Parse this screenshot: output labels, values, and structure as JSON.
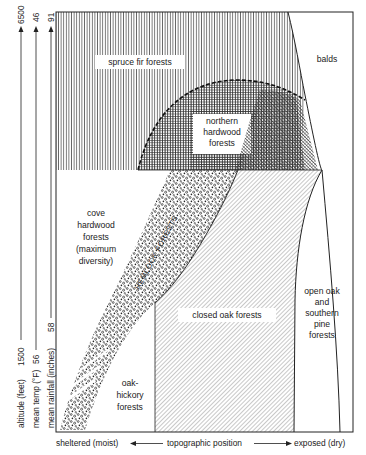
{
  "diagram": {
    "type": "vegetation zonation diagram",
    "y_axes": [
      {
        "id": "altitude",
        "label": "altitude (feet)",
        "low": "1500",
        "high": "6500"
      },
      {
        "id": "temp",
        "label": "mean temp (°F)",
        "low": "56",
        "high": "46"
      },
      {
        "id": "rainfall",
        "label": "mean rainfall (inches)",
        "low": "58",
        "high": "91"
      }
    ],
    "x_axis": {
      "left": "sheltered (moist)",
      "center": "topographic position",
      "right": "exposed (dry)"
    },
    "zones": [
      {
        "id": "spruce-fir",
        "label": "spruce fir forests",
        "pattern": "vertical lines"
      },
      {
        "id": "balds",
        "label": "balds",
        "pattern": "none"
      },
      {
        "id": "northern-hardwood",
        "label_lines": [
          "northern",
          "hardwood",
          "forests"
        ],
        "pattern": "crosshatch / horizontal lines"
      },
      {
        "id": "cove-hardwood",
        "label_lines": [
          "cove",
          "hardwood",
          "forests",
          "(maximum",
          "diversity)"
        ],
        "pattern": "none"
      },
      {
        "id": "hemlock",
        "label": "HEMLOCK FORESTS",
        "pattern": "stipple"
      },
      {
        "id": "closed-oak",
        "label": "closed oak forests",
        "pattern": "diagonal lines"
      },
      {
        "id": "open-oak-pine",
        "label_lines": [
          "open oak",
          "and",
          "southern",
          "pine",
          "forests"
        ],
        "pattern": "none"
      },
      {
        "id": "oak-hickory",
        "label_lines": [
          "oak-",
          "hickory",
          "forests"
        ],
        "pattern": "none"
      }
    ],
    "colors": {
      "ink": "#222222",
      "paper": "#ffffff"
    }
  }
}
